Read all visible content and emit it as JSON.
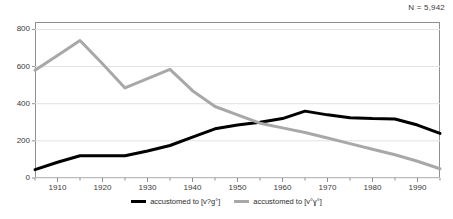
{
  "annotations": {
    "n_label": "N = 5,942"
  },
  "legend": {
    "items": [
      {
        "label": "accustomed to [v?g°]",
        "color": "#000000",
        "key": "series-black"
      },
      {
        "label": "accustomed to [v°ɣ°]",
        "color": "#a8a8a8",
        "key": "series-grey"
      }
    ]
  },
  "axes": {
    "y_ticks": [
      "800",
      "600",
      "400",
      "200",
      "0"
    ],
    "x_ticks": [
      "1910",
      "1920",
      "1930",
      "1940",
      "1950",
      "1960",
      "1970",
      "1980",
      "1990"
    ]
  },
  "chart_data": {
    "type": "line",
    "title": "",
    "subtitle": "",
    "xlabel": "",
    "ylabel": "",
    "xlim": [
      1905,
      1995
    ],
    "ylim": [
      0,
      840
    ],
    "grid": true,
    "grid_axis": "y",
    "legend_position": "bottom-center",
    "annotation": "N = 5,942",
    "x": [
      1905,
      1910,
      1915,
      1920,
      1925,
      1930,
      1935,
      1940,
      1945,
      1950,
      1955,
      1960,
      1965,
      1970,
      1975,
      1980,
      1985,
      1990,
      1995
    ],
    "series": [
      {
        "name": "accustomed to [v?g°]",
        "color": "#000000",
        "width": 3,
        "values": [
          45,
          85,
          120,
          120,
          120,
          145,
          175,
          220,
          265,
          285,
          300,
          320,
          360,
          340,
          325,
          320,
          318,
          285,
          240
        ]
      },
      {
        "name": "accustomed to [v°ɣ°]",
        "color": "#a8a8a8",
        "width": 3,
        "values": [
          580,
          660,
          740,
          615,
          485,
          535,
          585,
          470,
          385,
          340,
          295,
          270,
          245,
          215,
          185,
          155,
          125,
          90,
          50
        ]
      }
    ]
  }
}
